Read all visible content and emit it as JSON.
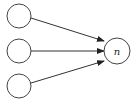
{
  "diagram": {
    "type": "neural-network-fan-in",
    "nodes": [
      {
        "id": "input-1",
        "label": "",
        "cx": 19,
        "cy": 16,
        "r": 12
      },
      {
        "id": "input-2",
        "label": "",
        "cx": 19,
        "cy": 51,
        "r": 12
      },
      {
        "id": "input-3",
        "label": "",
        "cx": 19,
        "cy": 86,
        "r": 12
      },
      {
        "id": "output",
        "label": "n",
        "cx": 117,
        "cy": 51,
        "r": 13
      }
    ],
    "edges": [
      {
        "from": "input-1",
        "to": "output"
      },
      {
        "from": "input-2",
        "to": "output"
      },
      {
        "from": "input-3",
        "to": "output"
      }
    ],
    "colors": {
      "stroke": "#444444",
      "background": "#ffffff"
    }
  }
}
